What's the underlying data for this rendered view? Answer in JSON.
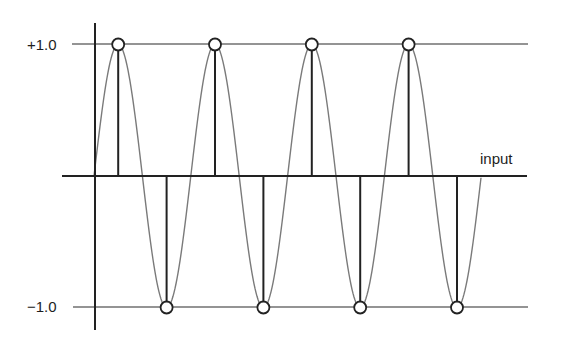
{
  "figure": {
    "labels": {
      "y_max": "+1.0",
      "y_min": "−1.0",
      "x_axis": "input"
    },
    "colors": {
      "background": "#ffffff",
      "axis": "#222222",
      "reference_lines": "#707070",
      "sine_curve": "#7a7a7a",
      "stems": "#222222",
      "sample_circle_stroke": "#222222",
      "sample_circle_fill": "#ffffff"
    }
  },
  "chart_data": {
    "type": "line",
    "title": "",
    "xlabel": "input",
    "ylabel": "",
    "ylim": [
      -1.0,
      1.0
    ],
    "y_tick_labels": [
      "+1.0",
      "−1.0"
    ],
    "grid": false,
    "series": [
      {
        "name": "sine wave",
        "style": "continuous gray curve",
        "periods": 4,
        "amplitude": 1.0
      },
      {
        "name": "samples",
        "style": "stems with open circles",
        "x": [
          0.25,
          0.75,
          1.25,
          1.75,
          2.25,
          2.75,
          3.25,
          3.75
        ],
        "values": [
          1.0,
          -1.0,
          1.0,
          -1.0,
          1.0,
          -1.0,
          1.0,
          -1.0
        ]
      }
    ]
  }
}
